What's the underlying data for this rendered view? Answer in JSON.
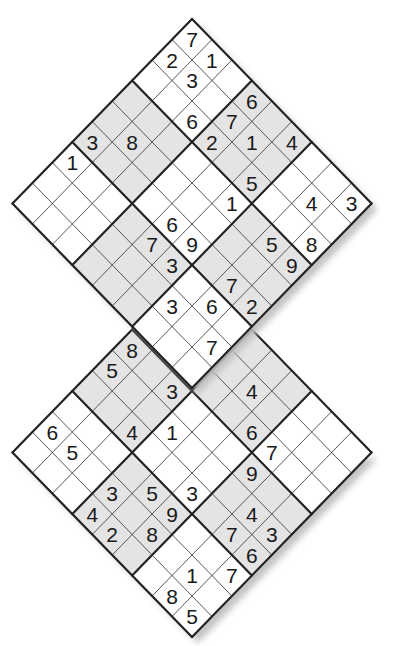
{
  "puzzle": {
    "type": "Twin Diagonal Sudoku (Samurai-style overlap)",
    "shade_color": "#e4e4e4",
    "cell_color": "#ffffff",
    "line_color": "#222222",
    "shadow_color": "#bdbdbd",
    "shaded_boxes": [
      [
        0,
        1
      ],
      [
        1,
        0
      ],
      [
        1,
        2
      ],
      [
        2,
        1
      ]
    ],
    "grids": [
      {
        "name": "top-grid",
        "apex": [
          192,
          19
        ],
        "givens": [
          {
            "r": 0,
            "c": 0,
            "v": "7"
          },
          {
            "r": 1,
            "c": 0,
            "v": "2"
          },
          {
            "r": 0,
            "c": 1,
            "v": "1"
          },
          {
            "r": 1,
            "c": 1,
            "v": "3"
          },
          {
            "r": 0,
            "c": 3,
            "v": "6"
          },
          {
            "r": 2,
            "c": 2,
            "v": "6"
          },
          {
            "r": 1,
            "c": 3,
            "v": "7"
          },
          {
            "r": 2,
            "c": 3,
            "v": "2"
          },
          {
            "r": 1,
            "c": 4,
            "v": "1"
          },
          {
            "r": 0,
            "c": 5,
            "v": "4"
          },
          {
            "r": 2,
            "c": 5,
            "v": "5"
          },
          {
            "r": 3,
            "c": 5,
            "v": "1"
          },
          {
            "r": 5,
            "c": 0,
            "v": "3"
          },
          {
            "r": 4,
            "c": 1,
            "v": "8"
          },
          {
            "r": 6,
            "c": 0,
            "v": "1"
          },
          {
            "r": 1,
            "c": 7,
            "v": "4"
          },
          {
            "r": 0,
            "c": 8,
            "v": "3"
          },
          {
            "r": 5,
            "c": 4,
            "v": "6"
          },
          {
            "r": 6,
            "c": 4,
            "v": "7"
          },
          {
            "r": 5,
            "c": 5,
            "v": "9"
          },
          {
            "r": 6,
            "c": 5,
            "v": "3"
          },
          {
            "r": 3,
            "c": 7,
            "v": "5"
          },
          {
            "r": 2,
            "c": 8,
            "v": "8"
          },
          {
            "r": 3,
            "c": 8,
            "v": "9"
          },
          {
            "r": 5,
            "c": 7,
            "v": "7"
          },
          {
            "r": 5,
            "c": 8,
            "v": "2"
          },
          {
            "r": 7,
            "c": 6,
            "v": "3"
          },
          {
            "r": 6,
            "c": 7,
            "v": "6"
          },
          {
            "r": 7,
            "c": 8,
            "v": "7"
          }
        ]
      },
      {
        "name": "bottom-grid",
        "apex": [
          192,
          268
        ],
        "givens": [
          {
            "r": 3,
            "c": 0,
            "v": "8"
          },
          {
            "r": 4,
            "c": 0,
            "v": "5"
          },
          {
            "r": 3,
            "c": 2,
            "v": "3"
          },
          {
            "r": 5,
            "c": 2,
            "v": "4"
          },
          {
            "r": 4,
            "c": 3,
            "v": "1"
          },
          {
            "r": 7,
            "c": 0,
            "v": "6"
          },
          {
            "r": 7,
            "c": 1,
            "v": "5"
          },
          {
            "r": 1,
            "c": 4,
            "v": "4"
          },
          {
            "r": 2,
            "c": 5,
            "v": "6"
          },
          {
            "r": 2,
            "c": 6,
            "v": "7"
          },
          {
            "r": 3,
            "c": 6,
            "v": "9"
          },
          {
            "r": 7,
            "c": 3,
            "v": "3"
          },
          {
            "r": 6,
            "c": 4,
            "v": "5"
          },
          {
            "r": 5,
            "c": 5,
            "v": "3"
          },
          {
            "r": 8,
            "c": 3,
            "v": "4"
          },
          {
            "r": 6,
            "c": 5,
            "v": "9"
          },
          {
            "r": 4,
            "c": 7,
            "v": "4"
          },
          {
            "r": 8,
            "c": 4,
            "v": "2"
          },
          {
            "r": 7,
            "c": 5,
            "v": "8"
          },
          {
            "r": 5,
            "c": 7,
            "v": "7"
          },
          {
            "r": 4,
            "c": 8,
            "v": "3"
          },
          {
            "r": 5,
            "c": 8,
            "v": "6"
          },
          {
            "r": 7,
            "c": 7,
            "v": "1"
          },
          {
            "r": 6,
            "c": 8,
            "v": "7"
          },
          {
            "r": 8,
            "c": 7,
            "v": "8"
          },
          {
            "r": 8,
            "c": 8,
            "v": "5"
          }
        ]
      }
    ],
    "cell_half_width": 19.95,
    "cell_half_height": 20.5
  }
}
